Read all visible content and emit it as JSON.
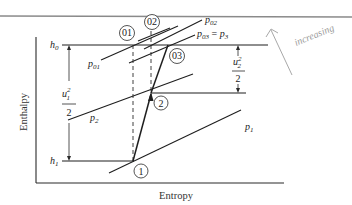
{
  "figure": {
    "type": "enthalpy-entropy (h-s) diagram",
    "axes": {
      "xlabel": "Entropy",
      "ylabel": "Enthalpy"
    },
    "enthalpy_levels": {
      "h0": "h",
      "h0_sub": "0",
      "h1": "h",
      "h1_sub": "1"
    },
    "states": [
      {
        "id": "1",
        "label": "1"
      },
      {
        "id": "2",
        "label": "2"
      },
      {
        "id": "01",
        "label": "01"
      },
      {
        "id": "02",
        "label": "02"
      },
      {
        "id": "03",
        "label": "03"
      }
    ],
    "isobars": {
      "p1": {
        "base": "p",
        "sub": "1"
      },
      "p2": {
        "base": "p",
        "sub": "2"
      },
      "p01": {
        "base": "p",
        "sub": "01"
      },
      "p02": {
        "base": "p",
        "sub": "02"
      },
      "p03": {
        "base": "p",
        "sub": "03",
        "eq": " = ",
        "rhs_base": "p",
        "rhs_sub": "3"
      }
    },
    "dimensions": {
      "u1": {
        "num_base": "u",
        "num_sub": "1",
        "num_sup": "2",
        "den": "2"
      },
      "u2": {
        "num_base": "u",
        "num_sub": "2",
        "num_sup": "2",
        "den": "2"
      }
    },
    "annotation": {
      "handwritten": "increasing"
    }
  }
}
